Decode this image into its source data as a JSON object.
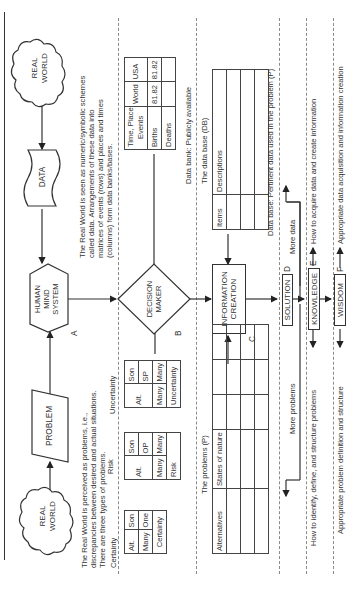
{
  "diagram": {
    "nodes": {
      "real_world_top": "REAL\nWORLD",
      "real_world_bottom": "REAL\nWORLD",
      "data": "DATA",
      "problem": "PROBLEM",
      "human_mind_system": "HUMAN\nMIND\nSYSTEM",
      "decision_maker": "DECISION\nMAKER",
      "information_creation": "INFORMATION\nCREATION",
      "solution": "SOLUTION",
      "knowledge": "KNOWLEDGE",
      "wisdom": "WISDOM"
    },
    "node_labels": {
      "a": "A",
      "b": "B",
      "c": "C",
      "d": "D",
      "e": "E",
      "f": "F"
    },
    "descriptions": {
      "data_desc": [
        "The Real World is seen as numeric/symbolic schemes",
        "called data. Arrangements of these data into",
        "matrices of events (rows) and places and times",
        "(columns) form data banks/bases."
      ],
      "problem_desc": [
        "The Real World is perceived as problems, i.e.,",
        "discrepancies between desired and actual situations.",
        "There are three types of problems."
      ],
      "problem_types": {
        "certainty": "Certainty",
        "risk": "Risk",
        "uncertainty": "Uncertainty"
      },
      "data_bank": "Data bank:  Publicly available",
      "data_base_title": "The data base (DB)",
      "problems_title": "The problems (P)",
      "data_base_pertinent": "Data base: Pertinent data used in the problem (P)",
      "more_data": "More data",
      "more_problems": "More problems",
      "knowledge_data": "How to acquire data and create information",
      "knowledge_problems": "How to identify, define, and structure problems",
      "wisdom_data": "Appropriate data acquisition and information creation",
      "wisdom_problems": "Appropriate problem definition and structure"
    },
    "data_bank_table": {
      "corner_top": "Time, Place",
      "corner_bottom": "Events",
      "columns": [
        "World",
        "USA"
      ],
      "rows": [
        {
          "label": "Births",
          "values": [
            "81.82",
            "81.82"
          ]
        },
        {
          "label": "Deaths",
          "values": [
            "",
            ""
          ]
        }
      ]
    },
    "db_table": {
      "col1": "Items",
      "col2": "Descriptions"
    },
    "problems_table": {
      "col1": "Alternatives",
      "col2": "States of nature"
    },
    "certainty_table": {
      "alt": "Alt.",
      "son": "Son",
      "alt_val": "Many",
      "son_val": "One",
      "caption": "Certainty"
    },
    "risk_table": {
      "alt": "Alt.",
      "son": "Son",
      "sub": "OP",
      "alt_val": "Many",
      "son_val": "Many",
      "caption": "Risk"
    },
    "uncertainty_table": {
      "alt": "Alt.",
      "son": "Son",
      "sub": "SP",
      "alt_val": "Many",
      "son_val": "Many",
      "caption": "Uncertainty"
    }
  }
}
